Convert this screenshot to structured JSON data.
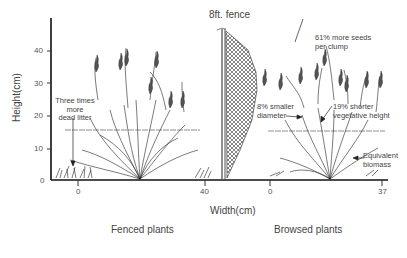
{
  "figure": {
    "fence_label": "8ft. fence",
    "y_axis": {
      "label": "Height(cm)",
      "ticks": [
        "0",
        "10",
        "20",
        "30",
        "40"
      ]
    },
    "x_axis": {
      "label": "Width(cm)",
      "fenced_ticks": [
        "0",
        "40"
      ],
      "browsed_ticks": [
        "0",
        "37"
      ]
    },
    "annotations": {
      "dead_litter": [
        "Three times",
        "more",
        "dead litter"
      ],
      "seeds": [
        "61% more seeds",
        "per clump"
      ],
      "diameter": [
        "8% smaller",
        "diameter"
      ],
      "height": [
        "19% shorter",
        "vegetative height"
      ],
      "biomass": [
        "Equivalent",
        "biomass"
      ]
    },
    "captions": {
      "fenced": "Fenced plants",
      "browsed": "Browsed plants"
    }
  }
}
